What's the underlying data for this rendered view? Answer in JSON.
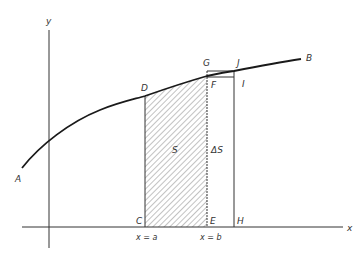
{
  "diagram": {
    "title": "",
    "colors": {
      "line": "#2a2a2a",
      "curve": "#1a1a1a",
      "hatch": "#555555",
      "text": "#333333",
      "background": "#ffffff"
    },
    "axes": {
      "x_label": "x",
      "y_label": "y"
    },
    "curve": {
      "start_label": "A",
      "end_label": "B"
    },
    "points": {
      "C": "C",
      "D": "D",
      "E": "E",
      "F": "F",
      "G": "G",
      "H": "H",
      "I": "I",
      "J": "J"
    },
    "regions": {
      "shaded_area": "S",
      "increment_area": "ΔS"
    },
    "bounds": {
      "left": "x = a",
      "right": "x = b"
    }
  }
}
